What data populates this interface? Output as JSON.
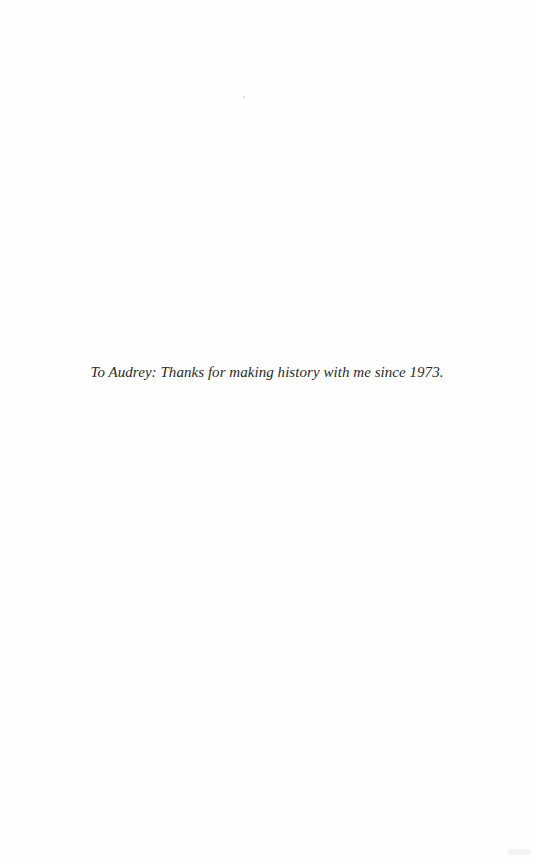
{
  "page": {
    "dedication": "To Audrey: Thanks for making history with me since 1973."
  }
}
